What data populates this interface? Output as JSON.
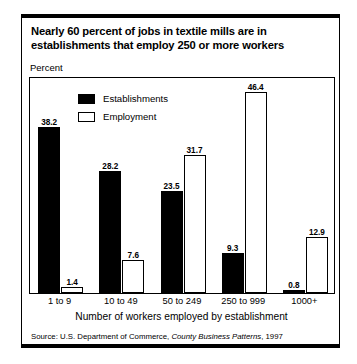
{
  "figure": {
    "title_line1": "Nearly 60 percent of jobs in textile mills are in",
    "title_line2": "establishments that employ 250 or more workers",
    "y_axis_label": "Percent",
    "x_axis_title": "Number of workers employed by establishment",
    "source_prefix": "Source: U.S. Department of Commerce, ",
    "source_italic": "County Business Patterns",
    "source_suffix": ", 1997"
  },
  "legend": {
    "items": [
      {
        "label": "Establishments",
        "swatch": "filled",
        "color": "#000000"
      },
      {
        "label": "Employment",
        "swatch": "hollow",
        "color": "#ffffff"
      }
    ]
  },
  "chart_data": {
    "type": "bar",
    "title": "Nearly 60 percent of jobs in textile mills are in establishments that employ 250 or more workers",
    "xlabel": "Number of workers employed by establishment",
    "ylabel": "Percent",
    "ylim": [
      0,
      50
    ],
    "grid": false,
    "legend_position": "top-left-inside",
    "categories": [
      "1 to 9",
      "10 to 49",
      "50 to 249",
      "250 to 999",
      "1000+"
    ],
    "series": [
      {
        "name": "Establishments",
        "color": "#000000",
        "values": [
          38.2,
          28.2,
          23.5,
          9.3,
          0.8
        ],
        "labels": [
          "38.2",
          "28.2",
          "23.5",
          "9.3",
          "0.8"
        ]
      },
      {
        "name": "Employment",
        "color": "#ffffff",
        "values": [
          1.4,
          7.6,
          31.7,
          46.4,
          12.9
        ],
        "labels": [
          "1.4",
          "7.6",
          "31.7",
          "46.4",
          "12.9"
        ]
      }
    ],
    "source": "Source: U.S. Department of Commerce, County Business Patterns, 1997"
  }
}
